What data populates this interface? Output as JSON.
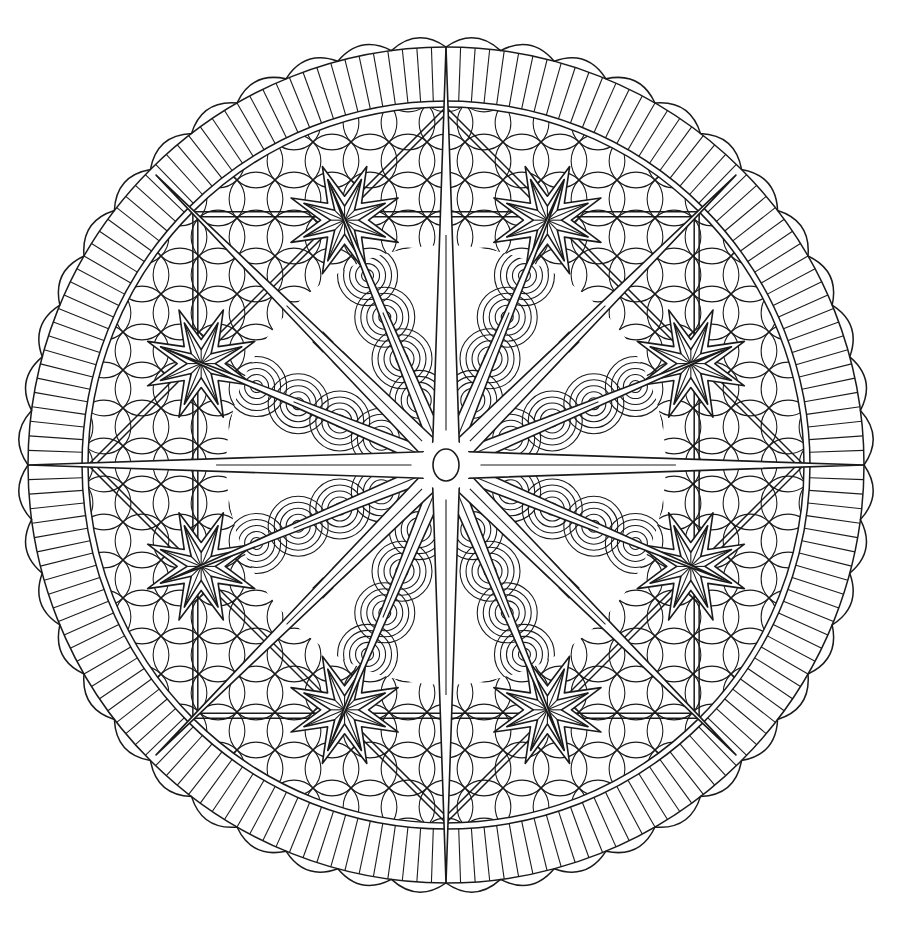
{
  "artwork": {
    "subject": "compass-rose mandala coloring page",
    "canvas": {
      "width": 909,
      "height": 931,
      "background": "#ffffff"
    },
    "ink_color": "#1a1a1a",
    "center": {
      "x": 446,
      "y": 465
    },
    "center_hub": {
      "rx": 13,
      "ry": 16
    },
    "scallop_border": {
      "count": 48,
      "outer_radius": 433,
      "base_radius": 418
    },
    "rib_band": {
      "outer_radius": 418,
      "inner_radius": 364,
      "rib_count": 180
    },
    "inner_rings": [
      364,
      358
    ],
    "compass_points": {
      "cardinal": {
        "count": 4,
        "length": 418,
        "half_width": 14
      },
      "diagonal": {
        "count": 4,
        "length": 410,
        "half_width": 11
      },
      "intermediate": {
        "count": 8,
        "length": 300,
        "half_width": 9
      }
    },
    "small_stars": {
      "count": 8,
      "orbit_radius": 265,
      "start_angle_deg": 22.5,
      "points": 8,
      "outer_radius": 58,
      "inner_radius": 24,
      "inner_star_outer_radius": 44,
      "inner_star_inner_radius": 14
    },
    "fill_patterns": [
      "overlapping-circle lattice",
      "concentric arcs",
      "diamond grid"
    ],
    "lattice": {
      "cell": 38,
      "min_radius": 200,
      "max_radius": 356
    },
    "arc_field": {
      "min_radius": 40,
      "max_radius": 220
    }
  }
}
